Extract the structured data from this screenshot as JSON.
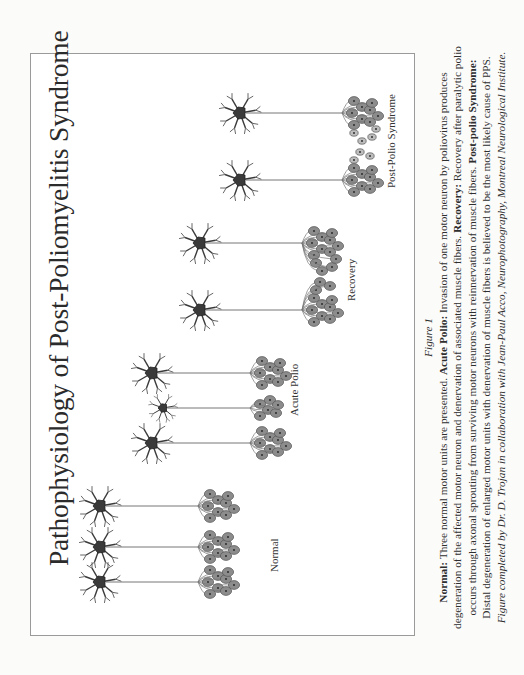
{
  "figure": {
    "title": "Pathophysiology of Post-Poliomyelitis Syndrome",
    "groups": [
      {
        "id": "normal",
        "label": "Normal",
        "motor_units": 3,
        "description": "three normal motor units"
      },
      {
        "id": "acute-polio",
        "label": "Acute Polio",
        "motor_units": 3,
        "description": "one motor neuron invaded by poliovirus, denervated fibers"
      },
      {
        "id": "recovery",
        "label": "Recovery",
        "motor_units": 2,
        "description": "surviving neurons sprout to reinnervate muscle fibers"
      },
      {
        "id": "post-polio-syndrome",
        "label": "Post-Polio Syndrome",
        "motor_units": 2,
        "description": "distal degeneration of enlarged motor units"
      }
    ]
  },
  "caption": {
    "figure_number": "Figure 1",
    "lines": [
      {
        "bold": "Normal:",
        "text": " Three normal motor units are presented. ",
        "bold2": "Acute Polio:",
        "text2": " Invasion of one motor neuron by poliovirus produces"
      },
      {
        "text": "degeneration of the affected motor neuron and denervation of associated muscle fibers. ",
        "bold": "Recovery:",
        "text2": " Recovery after paralytic polio"
      },
      {
        "text": "occurs through axonal sprouting from surviving motor neurons with reinnervation of muscle fibers. ",
        "bold": "Post-polio Syndrome:"
      },
      {
        "text": "Distal degeneration of enlarged motor units with denervation of muscle fibers is believed to be the most likely cause of PPS."
      }
    ],
    "credit": "Figure completed by Dr. D. Trojan in collaboration with Jean-Paul Acco, Neurophotography, Montreal Neurological Institute."
  },
  "colors": {
    "background": "#fbfbfa",
    "frame_border": "#9a9a9a",
    "soma": "#3a3a3a",
    "muscle_fiber_fill": "#8c8c8c",
    "muscle_fiber_stroke": "#555555",
    "axon": "#666666"
  }
}
